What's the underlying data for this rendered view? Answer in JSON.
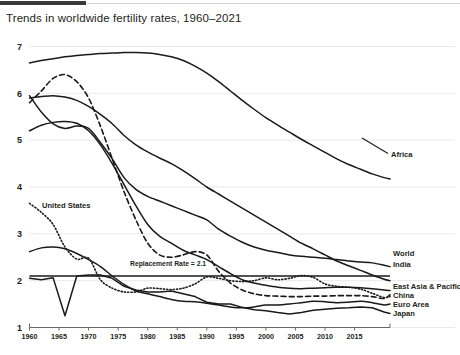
{
  "header": {
    "tab_accent": "#3a3a3a",
    "rule_color": "#d3d3d3"
  },
  "chart_title": "Trends in worldwide fertility rates, 1960–2021",
  "chart_data": {
    "type": "line",
    "title": "Trends in worldwide fertility rates, 1960–2021",
    "xlabel": "",
    "ylabel": "",
    "xlim": [
      1960,
      2021
    ],
    "ylim": [
      1,
      7
    ],
    "grid": true,
    "legend_position": "right-inline-labels",
    "yticks": [
      1,
      2,
      3,
      4,
      5,
      6,
      7
    ],
    "xticks": [
      1960,
      1965,
      1970,
      1975,
      1980,
      1985,
      1990,
      1995,
      2000,
      2005,
      2010,
      2015
    ],
    "annotations": [
      {
        "text": "Replacement Rate = 2.1",
        "x": 1975,
        "y": 2.1
      },
      {
        "text": "United States",
        "x": 1963,
        "y": 3.2
      }
    ],
    "x": [
      1960,
      1962,
      1964,
      1966,
      1968,
      1970,
      1972,
      1974,
      1976,
      1978,
      1980,
      1982,
      1984,
      1986,
      1988,
      1990,
      1992,
      1994,
      1996,
      1998,
      2000,
      2002,
      2004,
      2006,
      2008,
      2010,
      2012,
      2014,
      2016,
      2018,
      2020,
      2021
    ],
    "series": [
      {
        "name": "Africa",
        "style": "solid",
        "label": "Africa",
        "values": [
          6.65,
          6.7,
          6.74,
          6.78,
          6.81,
          6.83,
          6.85,
          6.86,
          6.87,
          6.87,
          6.86,
          6.83,
          6.78,
          6.7,
          6.58,
          6.43,
          6.25,
          6.05,
          5.85,
          5.66,
          5.48,
          5.32,
          5.17,
          5.02,
          4.88,
          4.74,
          4.6,
          4.48,
          4.38,
          4.28,
          4.2,
          4.17
        ]
      },
      {
        "name": "World",
        "style": "solid",
        "label": "World",
        "values": [
          5.95,
          5.6,
          5.35,
          5.25,
          5.3,
          5.25,
          4.95,
          4.6,
          4.2,
          3.95,
          3.8,
          3.7,
          3.6,
          3.5,
          3.4,
          3.3,
          3.1,
          2.95,
          2.82,
          2.72,
          2.65,
          2.6,
          2.55,
          2.52,
          2.5,
          2.48,
          2.45,
          2.42,
          2.4,
          2.38,
          2.33,
          2.3
        ]
      },
      {
        "name": "India",
        "style": "solid",
        "label": "India",
        "values": [
          5.9,
          5.93,
          5.95,
          5.92,
          5.85,
          5.72,
          5.55,
          5.35,
          5.1,
          4.9,
          4.75,
          4.62,
          4.5,
          4.35,
          4.18,
          4.0,
          3.85,
          3.7,
          3.55,
          3.4,
          3.25,
          3.1,
          2.95,
          2.8,
          2.68,
          2.55,
          2.42,
          2.32,
          2.22,
          2.12,
          2.03,
          2.0
        ]
      },
      {
        "name": "East Asia & Pacific",
        "style": "solid",
        "label": "East Asia & Pacific",
        "values": [
          5.2,
          5.32,
          5.38,
          5.4,
          5.36,
          5.2,
          4.9,
          4.5,
          4.05,
          3.6,
          3.2,
          2.95,
          2.8,
          2.65,
          2.55,
          2.45,
          2.3,
          2.15,
          2.02,
          1.95,
          1.9,
          1.86,
          1.84,
          1.83,
          1.84,
          1.85,
          1.86,
          1.86,
          1.85,
          1.83,
          1.8,
          1.79
        ]
      },
      {
        "name": "China",
        "style": "dashed",
        "label": "China",
        "values": [
          5.8,
          6.05,
          6.32,
          6.4,
          6.25,
          5.9,
          5.3,
          4.6,
          3.9,
          3.3,
          2.8,
          2.55,
          2.5,
          2.55,
          2.62,
          2.55,
          2.2,
          1.95,
          1.8,
          1.72,
          1.68,
          1.67,
          1.66,
          1.66,
          1.67,
          1.67,
          1.68,
          1.68,
          1.68,
          1.66,
          1.62,
          1.7
        ]
      },
      {
        "name": "Euro Area",
        "style": "solid",
        "label": "Euro Area",
        "values": [
          2.62,
          2.7,
          2.72,
          2.68,
          2.58,
          2.45,
          2.3,
          2.1,
          1.92,
          1.78,
          1.72,
          1.66,
          1.6,
          1.56,
          1.55,
          1.52,
          1.48,
          1.44,
          1.42,
          1.44,
          1.48,
          1.48,
          1.5,
          1.53,
          1.56,
          1.55,
          1.53,
          1.54,
          1.56,
          1.53,
          1.48,
          1.5
        ]
      },
      {
        "name": "Japan",
        "style": "solid",
        "label": "Japan",
        "values": [
          2.05,
          2.02,
          2.06,
          1.25,
          2.1,
          2.12,
          2.12,
          2.05,
          1.88,
          1.8,
          1.76,
          1.76,
          1.78,
          1.72,
          1.66,
          1.54,
          1.5,
          1.5,
          1.43,
          1.38,
          1.36,
          1.32,
          1.29,
          1.32,
          1.37,
          1.39,
          1.41,
          1.42,
          1.44,
          1.42,
          1.33,
          1.3
        ]
      },
      {
        "name": "United States",
        "style": "dotted",
        "label": "United States",
        "values": [
          3.65,
          3.46,
          3.2,
          2.72,
          2.46,
          2.48,
          2.02,
          1.84,
          1.76,
          1.76,
          1.84,
          1.83,
          1.81,
          1.84,
          1.93,
          2.08,
          2.05,
          2.0,
          1.98,
          2.0,
          2.06,
          2.02,
          2.05,
          2.11,
          2.07,
          1.93,
          1.88,
          1.86,
          1.82,
          1.73,
          1.64,
          1.66
        ]
      }
    ]
  }
}
